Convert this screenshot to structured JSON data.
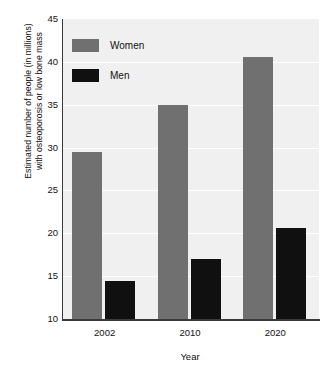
{
  "chart_data": {
    "type": "bar",
    "title": "",
    "subtitle": "",
    "xlabel": "Year",
    "ylabel": "Estimated number of people (in millions) with osteoporosis or low bone mass",
    "ylabel_lines": [
      "Estimated number of people (in millions)",
      "with osteoporosis or low bone mass"
    ],
    "categories": [
      "2002",
      "2010",
      "2020"
    ],
    "series": [
      {
        "name": "Women",
        "color": "#707070",
        "values": [
          29.5,
          35.0,
          40.6
        ]
      },
      {
        "name": "Men",
        "color": "#101010",
        "values": [
          14.4,
          17.0,
          20.6
        ]
      }
    ],
    "ylim": [
      10,
      45
    ],
    "yticks": [
      "45",
      "40",
      "35",
      "30",
      "25",
      "20",
      "15",
      "10"
    ],
    "ytick_values": [
      45,
      40,
      35,
      30,
      25,
      20,
      15,
      10
    ],
    "grid": true,
    "grid_color": "#ffffff",
    "plot_background": "#f0f0f0",
    "axis_color": "#3a3a3a",
    "legend_position": "top-left",
    "legend": [
      {
        "label": "Women",
        "color": "#707070"
      },
      {
        "label": "Men",
        "color": "#101010"
      }
    ]
  }
}
